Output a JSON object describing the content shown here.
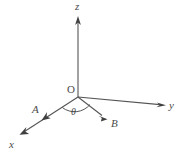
{
  "figure": {
    "type": "vector-diagram",
    "background_color": "#ffffff",
    "stroke_color": "#4a4a4a",
    "text_color": "#4a4a4a"
  },
  "origin": {
    "label": "O",
    "x": 78,
    "y": 97,
    "label_x": 67,
    "label_y": 84
  },
  "axes": [
    {
      "id": "z",
      "label": "z",
      "from_x": 78,
      "from_y": 97,
      "to_x": 78,
      "to_y": 20,
      "label_x": 75,
      "label_y": 1,
      "direction": "up"
    },
    {
      "id": "y",
      "label": "y",
      "from_x": 78,
      "from_y": 97,
      "to_x": 163,
      "to_y": 105,
      "label_x": 169,
      "label_y": 100,
      "direction": "right"
    },
    {
      "id": "x",
      "label": "x",
      "from_x": 78,
      "from_y": 97,
      "to_x": 22,
      "to_y": 133,
      "label_x": 9,
      "label_y": 139,
      "direction": "down-left"
    }
  ],
  "vectors": [
    {
      "id": "A",
      "label": "A",
      "from_x": 78,
      "from_y": 97,
      "to_x": 45,
      "to_y": 118,
      "label_x": 32,
      "label_y": 104,
      "note": "arrowhead drawn on the x-axis line"
    },
    {
      "id": "B",
      "label": "B",
      "from_x": 78,
      "from_y": 97,
      "to_x": 106,
      "to_y": 118,
      "label_x": 111,
      "label_y": 118,
      "note": "vector between x-axis and y-axis region"
    }
  ],
  "angle": {
    "label": "θ",
    "label_x": 71,
    "label_y": 107,
    "between": [
      "A",
      "B"
    ],
    "arc_radius": 20
  }
}
